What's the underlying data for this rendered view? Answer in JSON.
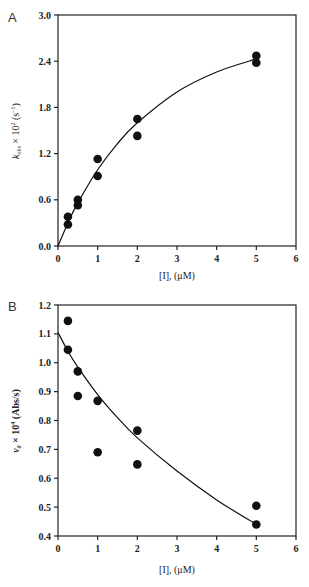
{
  "chart_data": [
    {
      "type": "scatter",
      "panel_label": "A",
      "title": "",
      "xlabel": "[I], (μM)",
      "ylabel": "k_obs × 10^2 (s^-1)",
      "ylabel_parts": {
        "k": "k",
        "sub": "obs",
        "mid": " × 10",
        "sup": "2",
        "unit": " (s",
        "unitsup": "−1",
        "close": ")"
      },
      "xlim": [
        0,
        6
      ],
      "ylim": [
        0,
        3.0
      ],
      "xticks": [
        "0",
        "1",
        "2",
        "3",
        "4",
        "5",
        "6"
      ],
      "yticks": [
        "0.0",
        "0.6",
        "1.2",
        "1.8",
        "2.4",
        "3.0"
      ],
      "ytick_values": [
        0,
        0.6,
        1.2,
        1.8,
        2.4,
        3.0
      ],
      "grid": false,
      "points": [
        {
          "x": 0.25,
          "y": 0.38
        },
        {
          "x": 0.25,
          "y": 0.28
        },
        {
          "x": 0.5,
          "y": 0.6
        },
        {
          "x": 0.5,
          "y": 0.53
        },
        {
          "x": 1.0,
          "y": 1.13
        },
        {
          "x": 1.0,
          "y": 0.91
        },
        {
          "x": 2.0,
          "y": 1.65
        },
        {
          "x": 2.0,
          "y": 1.43
        },
        {
          "x": 5.0,
          "y": 2.47
        },
        {
          "x": 5.0,
          "y": 2.38
        }
      ],
      "fit_curve": {
        "model": "hyperbolic",
        "x": [
          0,
          0.25,
          0.5,
          1,
          1.5,
          2,
          3,
          4,
          5
        ],
        "y": [
          0,
          0.3,
          0.56,
          0.99,
          1.33,
          1.6,
          2.0,
          2.26,
          2.43
        ]
      }
    },
    {
      "type": "scatter",
      "panel_label": "B",
      "title": "",
      "xlabel": "[I], (μM)",
      "ylabel": "v0 × 10^4 (Abs/s)",
      "ylabel_parts": {
        "v": "v",
        "sub": "0",
        "mid": " × 10",
        "sup": "4",
        "unit": " (Abs/s)"
      },
      "xlim": [
        0,
        6
      ],
      "ylim": [
        0.4,
        1.2
      ],
      "xticks": [
        "0",
        "1",
        "2",
        "3",
        "4",
        "5",
        "6"
      ],
      "yticks": [
        "0.4",
        "0.5",
        "0.6",
        "0.7",
        "0.8",
        "0.9",
        "1.0",
        "1.1",
        "1.2"
      ],
      "ytick_values": [
        0.4,
        0.5,
        0.6,
        0.7,
        0.8,
        0.9,
        1.0,
        1.1,
        1.2
      ],
      "grid": false,
      "points": [
        {
          "x": 0.25,
          "y": 1.145
        },
        {
          "x": 0.25,
          "y": 1.045
        },
        {
          "x": 0.5,
          "y": 0.97
        },
        {
          "x": 0.5,
          "y": 0.885
        },
        {
          "x": 1.0,
          "y": 0.868
        },
        {
          "x": 1.0,
          "y": 0.69
        },
        {
          "x": 2.0,
          "y": 0.765
        },
        {
          "x": 2.0,
          "y": 0.648
        },
        {
          "x": 5.0,
          "y": 0.505
        },
        {
          "x": 5.0,
          "y": 0.44
        }
      ],
      "fit_curve": {
        "model": "exponential-decay",
        "x": [
          0,
          0.25,
          0.5,
          1,
          1.5,
          2,
          3,
          4,
          5
        ],
        "y": [
          1.105,
          1.04,
          0.985,
          0.89,
          0.81,
          0.74,
          0.625,
          0.525,
          0.44
        ]
      }
    }
  ]
}
